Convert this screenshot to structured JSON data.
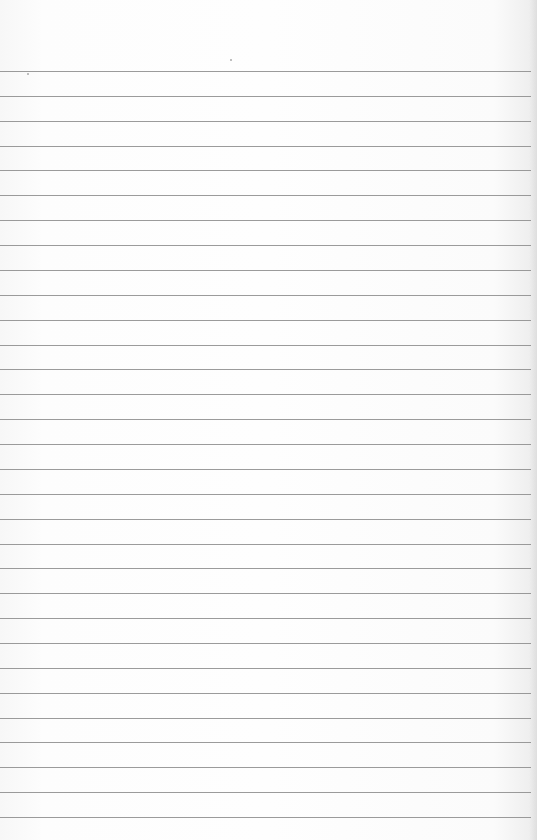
{
  "page": {
    "type": "blank lined notebook paper",
    "background_color": "#fbfbfb",
    "rule_color": "#8a8a8a",
    "rule_count": 31,
    "first_rule_y": 71,
    "rule_spacing_px": 24.87,
    "rule_length_px": 531,
    "text_content": ""
  }
}
